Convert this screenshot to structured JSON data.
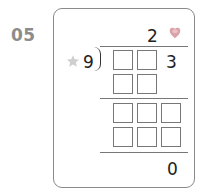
{
  "problem": {
    "number": "05",
    "quotient_digit": "2",
    "divisor": "9",
    "dividend_digit": "3",
    "remainder": "0",
    "icons": {
      "heart": "heart-icon",
      "star": "star-icon"
    },
    "colors": {
      "heart": "#d9a3a8",
      "star": "#cfcfcf",
      "border": "#8a8a8a"
    }
  }
}
